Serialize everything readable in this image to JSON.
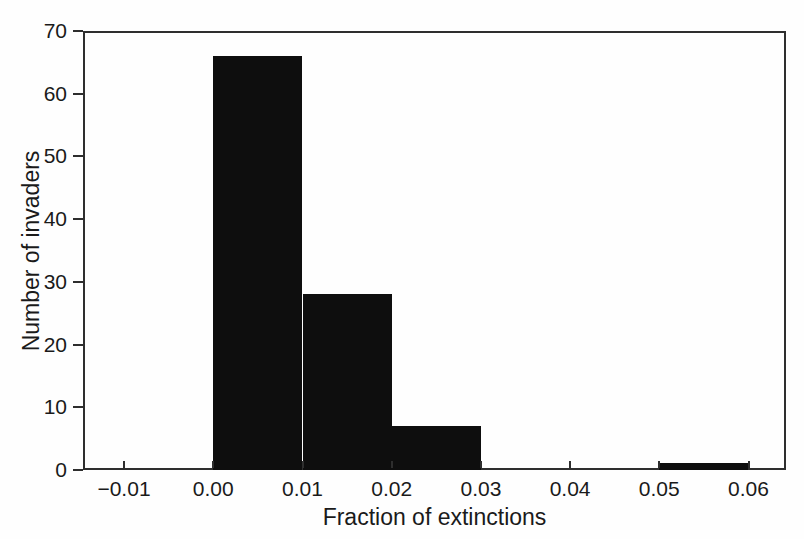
{
  "chart_data": {
    "type": "bar",
    "subtype": "histogram",
    "xlabel": "Fraction of extinctions",
    "ylabel": "Number of invaders",
    "categories": [
      "0.00-0.01",
      "0.01-0.02",
      "0.02-0.03",
      "0.05-0.06"
    ],
    "values": [
      66,
      28,
      7,
      1
    ],
    "bins": [
      {
        "x_start": 0.0,
        "x_end": 0.01,
        "count": 66
      },
      {
        "x_start": 0.01,
        "x_end": 0.02,
        "count": 28
      },
      {
        "x_start": 0.02,
        "x_end": 0.03,
        "count": 7
      },
      {
        "x_start": 0.05,
        "x_end": 0.06,
        "count": 1
      }
    ],
    "x_ticks": [
      {
        "value": -0.01,
        "label": "−0.01"
      },
      {
        "value": 0.0,
        "label": "0.00"
      },
      {
        "value": 0.01,
        "label": "0.01"
      },
      {
        "value": 0.02,
        "label": "0.02"
      },
      {
        "value": 0.03,
        "label": "0.03"
      },
      {
        "value": 0.04,
        "label": "0.04"
      },
      {
        "value": 0.05,
        "label": "0.05"
      },
      {
        "value": 0.06,
        "label": "0.06"
      }
    ],
    "y_ticks": [
      {
        "value": 0,
        "label": "0"
      },
      {
        "value": 10,
        "label": "10"
      },
      {
        "value": 20,
        "label": "20"
      },
      {
        "value": 30,
        "label": "30"
      },
      {
        "value": 40,
        "label": "40"
      },
      {
        "value": 50,
        "label": "50"
      },
      {
        "value": 60,
        "label": "60"
      },
      {
        "value": 70,
        "label": "70"
      }
    ],
    "xlim": [
      -0.0146,
      0.0642
    ],
    "ylim": [
      0,
      70
    ],
    "grid": false,
    "legend": "none",
    "bar_color": "#0e0e0e",
    "axis_color": "#2e2e2e",
    "text_color": "#1a1a1a",
    "background_color": "#fefefe"
  }
}
